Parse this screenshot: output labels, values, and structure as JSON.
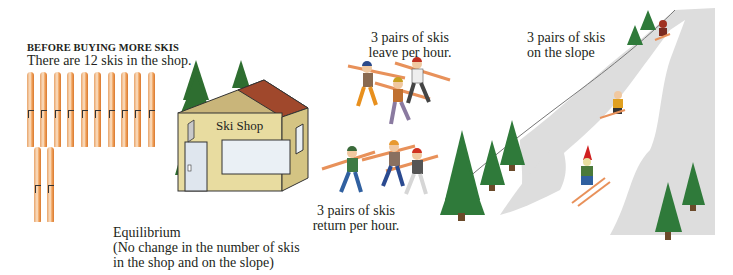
{
  "before": {
    "heading": "BEFORE BUYING MORE SKIS",
    "subtitle": "There are 12 skis in the shop.",
    "ski_count": 12,
    "ski_color": "#f0a25c"
  },
  "shop": {
    "sign": "Ski Shop",
    "wall_color": "#e8dca0",
    "roof_color": "#a0482c"
  },
  "leave": {
    "line1": "3 pairs of skis",
    "line2": "leave per hour."
  },
  "return": {
    "line1": "3 pairs of skis",
    "line2": "return per hour."
  },
  "slope": {
    "line1": "3 pairs of skis",
    "line2": "on the slope",
    "slope_color": "#dcdcdc",
    "tree_color": "#2e7a3a"
  },
  "equilibrium": {
    "line1": "Equilibrium",
    "line2": "(No change in the number of skis",
    "line3": "in the shop and on the slope)"
  }
}
